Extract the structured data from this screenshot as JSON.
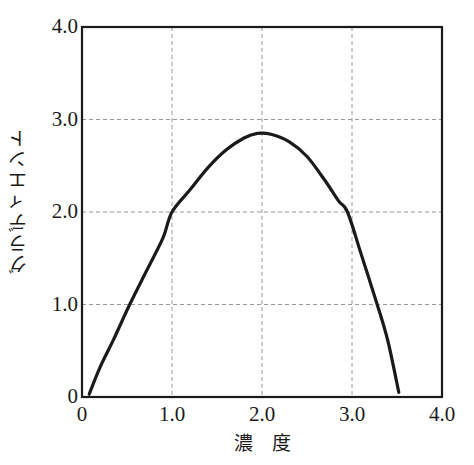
{
  "chart_data": {
    "type": "line",
    "title": "",
    "subtitle": "",
    "xlabel": "濃　度",
    "ylabel": "グラディエント",
    "xlim": [
      0,
      4.0
    ],
    "ylim": [
      0,
      4.0
    ],
    "grid": true,
    "legend": false,
    "legend_position": "none",
    "xticks": [
      0,
      1.0,
      2.0,
      3.0,
      4.0
    ],
    "xticklabels": [
      "0",
      "1.0",
      "2.0",
      "3.0",
      "4.0"
    ],
    "yticks": [
      0,
      1.0,
      2.0,
      3.0,
      4.0
    ],
    "yticklabels": [
      "0",
      "1.0",
      "2.0",
      "3.0",
      "4.0"
    ],
    "series": [
      {
        "name": "gradient-curve",
        "color": "#1a1a1a",
        "linewidth": 3.2,
        "x": [
          0.08,
          0.2,
          0.35,
          0.53,
          0.72,
          0.9,
          1.0,
          1.2,
          1.4,
          1.6,
          1.8,
          1.95,
          2.1,
          2.3,
          2.5,
          2.7,
          2.85,
          2.95,
          3.1,
          3.28,
          3.4,
          3.52
        ],
        "y": [
          0.03,
          0.32,
          0.62,
          1.0,
          1.37,
          1.72,
          2.0,
          2.24,
          2.48,
          2.67,
          2.8,
          2.85,
          2.84,
          2.76,
          2.6,
          2.34,
          2.12,
          2.0,
          1.55,
          1.0,
          0.6,
          0.05
        ]
      }
    ],
    "annotations": []
  },
  "axes": {
    "frame_color": "#1a1a1a",
    "grid_color": "#9a9a9a",
    "grid_style": "dashed",
    "background": "#ffffff"
  }
}
